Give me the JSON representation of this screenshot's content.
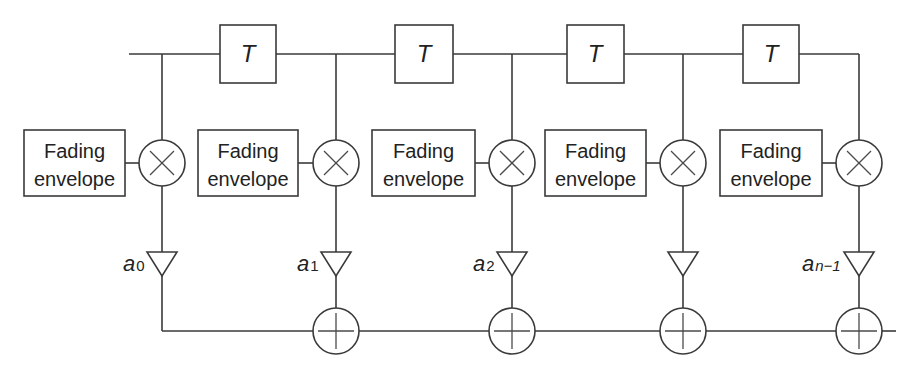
{
  "diagram": {
    "title": "",
    "delay_label": "T",
    "fading_label_line1": "Fading",
    "fading_label_line2": "envelope",
    "delays": [
      {
        "label": "T"
      },
      {
        "label": "T"
      },
      {
        "label": "T"
      },
      {
        "label": "T"
      }
    ],
    "taps": [
      {
        "fading_line1": "Fading",
        "fading_line2": "envelope",
        "multiplier": "×",
        "coef_base": "a",
        "coef_sub": "0",
        "adder": "+"
      },
      {
        "fading_line1": "Fading",
        "fading_line2": "envelope",
        "multiplier": "×",
        "coef_base": "a",
        "coef_sub": "1",
        "adder": "+"
      },
      {
        "fading_line1": "Fading",
        "fading_line2": "envelope",
        "multiplier": "×",
        "coef_base": "a",
        "coef_sub": "2",
        "adder": "+"
      },
      {
        "fading_line1": "Fading",
        "fading_line2": "envelope",
        "multiplier": "×",
        "coef_base": "",
        "coef_sub": "",
        "adder": "+"
      },
      {
        "fading_line1": "Fading",
        "fading_line2": "envelope",
        "multiplier": "×",
        "coef_base": "a",
        "coef_sub": "n−1",
        "adder": "+"
      }
    ],
    "colors": {
      "stroke": "#3a3a3a",
      "background": "#ffffff"
    }
  }
}
